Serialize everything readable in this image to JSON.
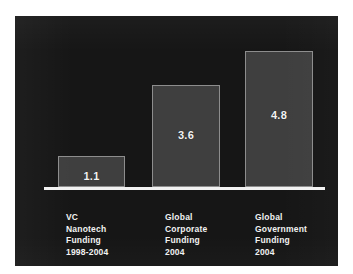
{
  "chart_data": {
    "type": "bar",
    "title": "",
    "subtitle": "",
    "xlabel": "",
    "ylabel": "",
    "grid": false,
    "legend": "none",
    "ylim": [
      0,
      5.4
    ],
    "units": "US$ billions",
    "categories": [
      "VC Nanotech Funding 1998-2004",
      "Global Corporate Funding 2004",
      "Global Government Funding 2004"
    ],
    "category_lines": [
      [
        "VC",
        "Nanotech",
        "Funding",
        "1998-2004"
      ],
      [
        "Global",
        "Corporate",
        "Funding",
        "2004"
      ],
      [
        "Global",
        "Government",
        "Funding",
        "2004"
      ]
    ],
    "values": [
      1.1,
      3.6,
      4.8
    ],
    "value_labels": [
      "1.1",
      "3.6",
      "4.8"
    ],
    "colors": {
      "background": "#161616",
      "bar_fill": "#3f3f3f",
      "bar_border": "#8d8d8d",
      "axis": "#f2f2f2",
      "text": "#f2f2f2"
    }
  }
}
